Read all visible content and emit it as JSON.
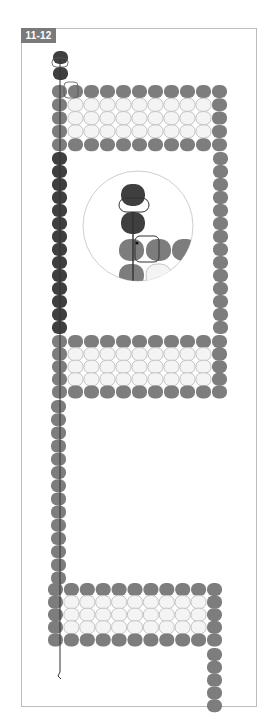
{
  "figure": {
    "label": "11-12",
    "colors": {
      "frame_border": "#bdbdbd",
      "label_bg": "#7a7a7a",
      "label_text": "#ffffff",
      "bead_dark": "#3f3f3f",
      "bead_medium": "#7d7d7d",
      "bead_light_fill": "#f4f4f4",
      "bead_light_stroke": "#c4c4c4",
      "thread": "#333333",
      "magnifier_ring": "#cfcfcf"
    },
    "bead_size": {
      "w": 15,
      "h": 13
    },
    "sections": [
      {
        "name": "top-dark-stack",
        "beads": [
          {
            "x": 53,
            "y": 51,
            "tone": "dark"
          },
          {
            "x": 53,
            "y": 67,
            "tone": "dark"
          }
        ]
      },
      {
        "name": "top-rectangle",
        "origin": {
          "x": 52,
          "y": 85
        },
        "cols": 11,
        "rows": 5,
        "pitch_x": 16,
        "pitch_y": 13.3,
        "light_interior": true
      },
      {
        "name": "dark-column",
        "origin": {
          "x": 52,
          "y": 152
        },
        "count": 14,
        "pitch_y": 13,
        "tone": "dark"
      },
      {
        "name": "right-column-top",
        "origin": {
          "x": 213,
          "y": 152
        },
        "count": 14,
        "pitch_y": 13,
        "tone": "medium"
      },
      {
        "name": "middle-rectangle",
        "origin": {
          "x": 52,
          "y": 335
        },
        "cols": 11,
        "rows": 5,
        "pitch_x": 16,
        "pitch_y": 12.6,
        "light_interior": true
      },
      {
        "name": "medium-column",
        "origin": {
          "x": 51,
          "y": 400
        },
        "count": 14,
        "pitch_y": 13.2,
        "tone": "medium"
      },
      {
        "name": "bottom-rectangle",
        "origin": {
          "x": 48,
          "y": 583
        },
        "cols": 11,
        "rows": 5,
        "pitch_x": 15.9,
        "pitch_y": 12.6,
        "light_interior": true
      },
      {
        "name": "bottom-right-tail",
        "origin": {
          "x": 207,
          "y": 648
        },
        "count": 5,
        "pitch_y": 12.8,
        "tone": "medium"
      }
    ],
    "thread": {
      "points": [
        [
          60,
          60
        ],
        [
          60,
          672
        ]
      ],
      "end_hook": [
        [
          60,
          672
        ],
        [
          58,
          676
        ],
        [
          61,
          679
        ]
      ]
    },
    "highlights": [
      {
        "x": 52,
        "y": 58,
        "w": 16,
        "h": 9,
        "note": "thread-loop-top"
      },
      {
        "x": 64,
        "y": 82,
        "w": 14,
        "h": 16,
        "note": "needle-exit-box"
      }
    ],
    "magnifier": {
      "cx": 138,
      "cy": 226,
      "r": 55,
      "zoom_beads": [
        {
          "x": 121,
          "y": 184,
          "w": 24,
          "h": 22,
          "tone": "dark"
        },
        {
          "x": 121,
          "y": 212,
          "w": 24,
          "h": 22,
          "tone": "dark"
        },
        {
          "x": 119,
          "y": 239,
          "w": 25,
          "h": 22,
          "tone": "medium"
        },
        {
          "x": 146,
          "y": 239,
          "w": 25,
          "h": 22,
          "tone": "medium"
        },
        {
          "x": 172,
          "y": 239,
          "w": 25,
          "h": 22,
          "tone": "medium"
        },
        {
          "x": 119,
          "y": 264,
          "w": 25,
          "h": 22,
          "tone": "medium"
        },
        {
          "x": 146,
          "y": 264,
          "w": 25,
          "h": 22,
          "tone": "light"
        },
        {
          "x": 172,
          "y": 264,
          "w": 25,
          "h": 22,
          "tone": "light"
        }
      ],
      "zoom_thread": [
        [
          133,
          212
        ],
        [
          133,
          282
        ]
      ],
      "zoom_loop": {
        "x": 119,
        "y": 198,
        "w": 30,
        "h": 14
      },
      "zoom_box": {
        "x": 135,
        "y": 236,
        "w": 24,
        "h": 26
      },
      "zoom_dot": {
        "x": 137,
        "y": 243
      }
    }
  }
}
